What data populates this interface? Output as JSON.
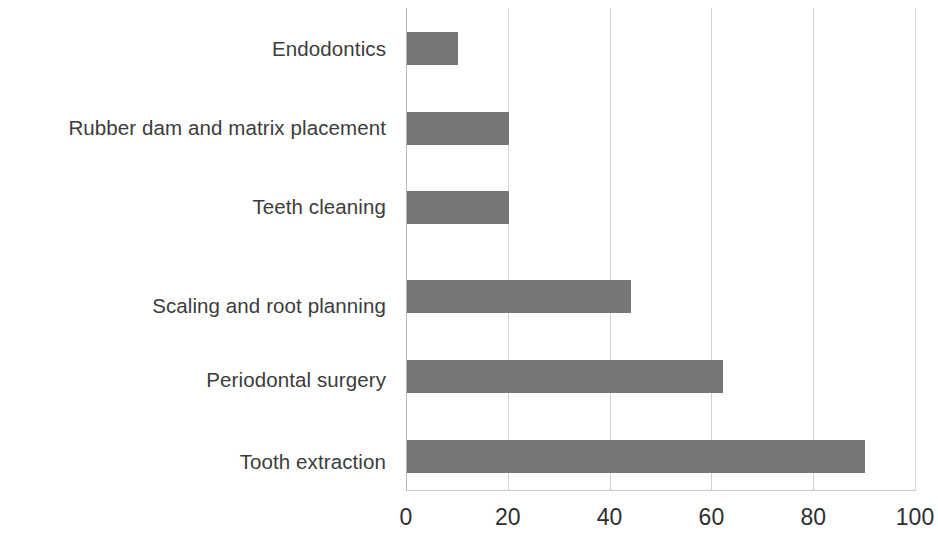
{
  "chart_data": {
    "type": "bar",
    "orientation": "horizontal",
    "title": "",
    "subtitle": "",
    "xlabel": "",
    "ylabel": "",
    "categories": [
      "Endodontics",
      "Rubber dam and matrix placement",
      "Teeth cleaning",
      "Scaling and root planning",
      "Periodontal surgery",
      "Tooth extraction"
    ],
    "values": [
      10,
      20,
      20,
      44,
      62,
      90
    ],
    "series": [
      {
        "name": "",
        "values": [
          10,
          20,
          20,
          44,
          62,
          90
        ]
      }
    ],
    "xlim": [
      0,
      100
    ],
    "xticks": [
      0,
      20,
      40,
      60,
      80,
      100
    ],
    "xtick_labels": [
      "0",
      "20",
      "40",
      "60",
      "80",
      "100"
    ],
    "grid": true,
    "grid_axis": "x",
    "legend": false,
    "legend_position": "none",
    "bar_color": "#767676",
    "gridline_color": "#d2d2d2",
    "axis_color": "#b6b6b6",
    "label_color": "#3c3c3c",
    "tick_label_color": "#2e2e2e",
    "background_color": "#ffffff"
  }
}
